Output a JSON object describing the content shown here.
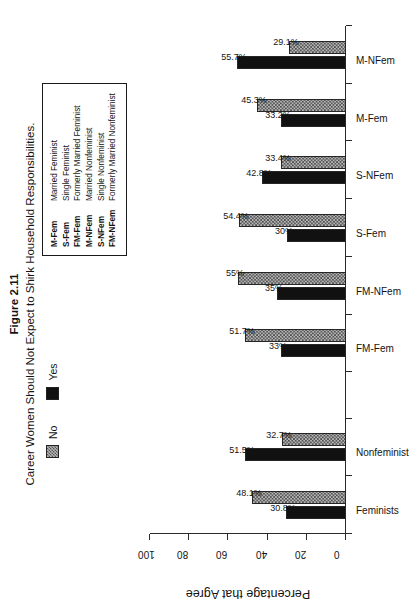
{
  "figure": {
    "number": "Figure 2.11",
    "title": "Career Women Should Not Expect to Shirk Household Responsibilities."
  },
  "legend": {
    "position": "top",
    "entries": [
      {
        "label": "No",
        "swatch": "hatched-gray"
      },
      {
        "label": "Yes",
        "swatch": "solid-black"
      }
    ]
  },
  "abbreviations": [
    {
      "key": "M-Fem",
      "value": "Married Feminist"
    },
    {
      "key": "S-Fem",
      "value": "Single Feminist"
    },
    {
      "key": "FM-Fem",
      "value": "Formerly Married Feminist"
    },
    {
      "key": "M-NFem",
      "value": "Married Nonfeminist"
    },
    {
      "key": "S-NFem",
      "value": "Single Nonfeminist"
    },
    {
      "key": "FM-NFem",
      "value": "Formerly Married Nonfeminist"
    }
  ],
  "chart_data": {
    "type": "bar",
    "title": "Career Women Should Not Expect to Shirk Household Responsibilities.",
    "xlabel": "",
    "ylabel": "Percentage that Agree",
    "ylim": [
      0,
      100
    ],
    "yticks": [
      0,
      20,
      40,
      60,
      80,
      100
    ],
    "ytick_labels": [
      "0",
      "20",
      "40",
      "60",
      "80",
      "100"
    ],
    "grid": false,
    "legend_position": "top",
    "categories": [
      "Feminists",
      "Nonfeminist",
      "",
      "FM-Fem",
      "FM-NFem",
      "S-Fem",
      "S-NFem",
      "M-Fem",
      "M-NFem"
    ],
    "series": [
      {
        "name": "Yes",
        "values": [
          30.8,
          51.5,
          null,
          33,
          35,
          30,
          42.8,
          33.2,
          55.7
        ],
        "labels": [
          "30.8%",
          "51.5%",
          "",
          "33%",
          "35%",
          "30%",
          "42.8%",
          "33.2%",
          "55.7%"
        ]
      },
      {
        "name": "No",
        "values": [
          48.1,
          32.7,
          null,
          51.7,
          55,
          54.4,
          33.4,
          45.3,
          29.1
        ],
        "labels": [
          "48.1%",
          "32.7%",
          "",
          "51.7%",
          "55%",
          "54.4%",
          "33.4%",
          "45.3%",
          "29.1%"
        ]
      }
    ]
  }
}
